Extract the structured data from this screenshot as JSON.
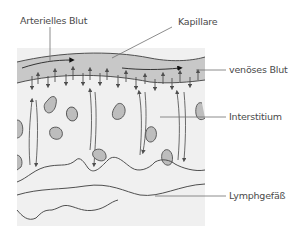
{
  "diagram": {
    "labels": {
      "arterial": "Arterielles Blut",
      "capillary": "Kapillare",
      "venous": "venöses Blut",
      "interstitium": "Interstitium",
      "lymph": "Lymphgefäß"
    },
    "colors": {
      "background_panel": "#f0f0f0",
      "capillary_fill": "#c8c8c8",
      "line": "#4f4f4f",
      "cell_fill": "#bdbdbd",
      "leader": "#6e6e6e"
    }
  }
}
